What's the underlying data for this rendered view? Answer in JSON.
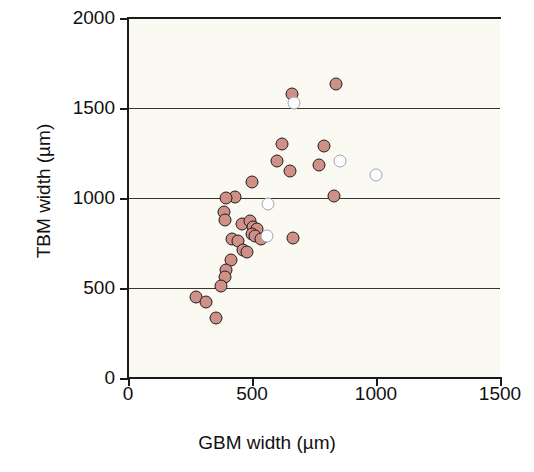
{
  "chart_data": {
    "type": "scatter",
    "title": "",
    "xlabel": "GBM width (µm)",
    "ylabel": "TBM width (µm)",
    "xlim": [
      0,
      1500
    ],
    "ylim": [
      0,
      2000
    ],
    "xticks": [
      0,
      500,
      1000,
      1500
    ],
    "yticks": [
      0,
      500,
      1000,
      1500,
      2000
    ],
    "xtick_labels": [
      "0",
      "500",
      "1000",
      "1500"
    ],
    "ytick_labels": [
      "0",
      "500",
      "1000",
      "1500",
      "2000"
    ],
    "grid": "horizontal gridlines at y = 500, 1000, 1500",
    "legend": null,
    "series": [
      {
        "name": "filled",
        "marker": "filled-circle",
        "color": "#d08f87",
        "edge_color": "#1d1d1d",
        "points": [
          [
            660,
            1580
          ],
          [
            840,
            1635
          ],
          [
            620,
            1300
          ],
          [
            600,
            1205
          ],
          [
            790,
            1290
          ],
          [
            770,
            1185
          ],
          [
            655,
            1150
          ],
          [
            500,
            1090
          ],
          [
            430,
            1005
          ],
          [
            395,
            1000
          ],
          [
            385,
            925
          ],
          [
            390,
            880
          ],
          [
            830,
            1010
          ],
          [
            460,
            855
          ],
          [
            490,
            875
          ],
          [
            505,
            840
          ],
          [
            520,
            830
          ],
          [
            500,
            800
          ],
          [
            510,
            790
          ],
          [
            535,
            775
          ],
          [
            665,
            780
          ],
          [
            420,
            775
          ],
          [
            445,
            760
          ],
          [
            465,
            710
          ],
          [
            480,
            700
          ],
          [
            415,
            655
          ],
          [
            395,
            600
          ],
          [
            390,
            560
          ],
          [
            375,
            510
          ],
          [
            275,
            450
          ],
          [
            315,
            425
          ],
          [
            355,
            335
          ]
        ]
      },
      {
        "name": "open",
        "marker": "open-circle",
        "color": "#fdfdfd",
        "edge_color": "#9ea3bb",
        "points": [
          [
            670,
            1530
          ],
          [
            855,
            1205
          ],
          [
            1000,
            1130
          ],
          [
            565,
            965
          ],
          [
            560,
            790
          ]
        ]
      }
    ],
    "n_points_filled": 32,
    "n_points_open": 5
  },
  "axes": {
    "x_title": "GBM width (µm)",
    "y_title": "TBM width (µm)",
    "x_ticks": [
      "0",
      "500",
      "1000",
      "1500"
    ],
    "y_ticks": [
      "0",
      "500",
      "1000",
      "1500",
      "2000"
    ]
  },
  "colors": {
    "plot_background": "#fbfaf2",
    "axis": "#1a1a1a",
    "gridline": "#3a3328",
    "marker_fill": "#d08f87",
    "marker_fill_edge": "#1d1d1d",
    "marker_open_fill": "#fdfdfd",
    "marker_open_edge": "#9ea3bb"
  },
  "caption": {
    "text": ""
  }
}
